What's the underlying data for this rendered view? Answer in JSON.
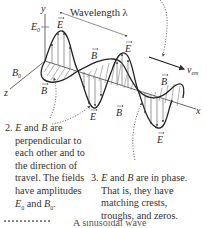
{
  "diagram": {
    "type": "electromagnetic-wave",
    "labels": {
      "y_axis": "y",
      "z_axis": "z",
      "x_axis": "x",
      "E0": "E",
      "E0_sub": "0",
      "B0": "B",
      "B0_sub": "0",
      "wavelength": "Wavelength λ",
      "velocity": "v",
      "velocity_sub": "em",
      "E_vec": "E",
      "B_vec": "B"
    },
    "notes": [
      {
        "number": "2.",
        "lines": [
          "and",
          "are",
          "perpendicular to",
          "each other and to",
          "the direction of",
          "travel. The fields",
          "have amplitudes",
          "and"
        ],
        "line1_a": "E",
        "line1_and": " and ",
        "line1_b": "B",
        "line1_end": " are",
        "line2": "perpendicular to",
        "line3": "each other and to",
        "line4": "the direction of",
        "line5": "travel. The fields",
        "line6": "have amplitudes",
        "line7_a": "E",
        "line7_a_sub": "0",
        "line7_and": " and ",
        "line7_b": "B",
        "line7_b_sub": "0",
        "line7_end": "."
      },
      {
        "number": "3.",
        "line1_a": "E",
        "line1_and": " and ",
        "line1_b": "B",
        "line1_end": " are in phase.",
        "line2": "That is, they have",
        "line3": "matching crests,",
        "line4": "troughs, and zeros."
      }
    ],
    "bottom_partial": "A sinusoidal wave"
  }
}
